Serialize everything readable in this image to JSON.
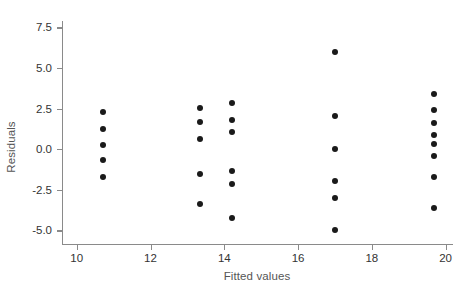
{
  "chart_data": {
    "type": "scatter",
    "title": "",
    "xlabel": "Fitted values",
    "ylabel": "Residuals",
    "xlim": [
      9.6,
      20.2
    ],
    "ylim": [
      -5.9,
      7.9
    ],
    "xticks": [
      10,
      12,
      14,
      16,
      18,
      20
    ],
    "xtick_labels": [
      "10",
      "12",
      "14",
      "16",
      "18",
      "20"
    ],
    "yticks": [
      -5.0,
      -2.5,
      0.0,
      2.5,
      5.0,
      7.5
    ],
    "ytick_labels": [
      "-5.0",
      "-2.5",
      "0.0",
      "2.5",
      "5.0",
      "7.5"
    ],
    "grid": false,
    "legend": false,
    "marker": "filled-circle",
    "marker_color": "#1a1a1a",
    "marker_size_px": 6,
    "points": [
      {
        "x": 10.72,
        "y": 2.3
      },
      {
        "x": 10.72,
        "y": 1.22
      },
      {
        "x": 10.72,
        "y": 0.25
      },
      {
        "x": 10.72,
        "y": -0.68
      },
      {
        "x": 10.72,
        "y": -1.72
      },
      {
        "x": 13.33,
        "y": 2.52
      },
      {
        "x": 13.33,
        "y": 1.7
      },
      {
        "x": 13.33,
        "y": 0.6
      },
      {
        "x": 13.33,
        "y": -1.5
      },
      {
        "x": 13.33,
        "y": -3.4
      },
      {
        "x": 14.2,
        "y": 2.82
      },
      {
        "x": 14.2,
        "y": 1.78
      },
      {
        "x": 14.2,
        "y": 1.05
      },
      {
        "x": 14.2,
        "y": -1.32
      },
      {
        "x": 14.2,
        "y": -2.12
      },
      {
        "x": 14.2,
        "y": -4.22
      },
      {
        "x": 17.0,
        "y": 6.02
      },
      {
        "x": 17.0,
        "y": 2.02
      },
      {
        "x": 17.0,
        "y": 0.0
      },
      {
        "x": 17.0,
        "y": -1.98
      },
      {
        "x": 17.0,
        "y": -3.02
      },
      {
        "x": 17.0,
        "y": -4.98
      },
      {
        "x": 19.68,
        "y": 3.4
      },
      {
        "x": 19.68,
        "y": 2.42
      },
      {
        "x": 19.68,
        "y": 1.6
      },
      {
        "x": 19.68,
        "y": 0.88
      },
      {
        "x": 19.68,
        "y": 0.3
      },
      {
        "x": 19.68,
        "y": -0.4
      },
      {
        "x": 19.68,
        "y": -1.72
      },
      {
        "x": 19.68,
        "y": -3.6
      }
    ],
    "n_points": 30,
    "clusters": [
      {
        "x": 10.72,
        "count": 5
      },
      {
        "x": 13.33,
        "count": 5
      },
      {
        "x": 14.2,
        "count": 6
      },
      {
        "x": 17.0,
        "count": 6
      },
      {
        "x": 19.68,
        "count": 8
      }
    ]
  }
}
